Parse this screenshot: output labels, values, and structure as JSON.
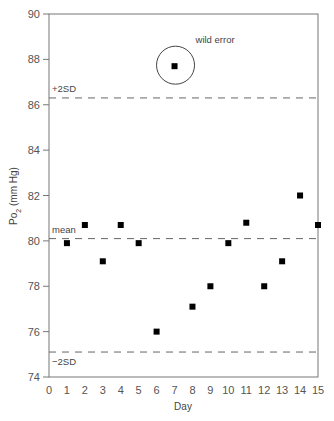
{
  "chart_data": {
    "type": "scatter",
    "title": "",
    "xlabel": "Day",
    "ylabel": "Po2 (mm Hg)",
    "ylabel_main": "Po",
    "ylabel_sub": "2",
    "ylabel_unit": " (mm Hg)",
    "xlim": [
      0,
      15
    ],
    "ylim": [
      74,
      90
    ],
    "x_ticks": [
      "0",
      "1",
      "2",
      "3",
      "4",
      "5",
      "6",
      "7",
      "8",
      "9",
      "10",
      "11",
      "12",
      "13",
      "14",
      "15"
    ],
    "y_ticks": [
      "74",
      "76",
      "78",
      "80",
      "82",
      "84",
      "86",
      "88",
      "90"
    ],
    "grid": false,
    "series": [
      {
        "name": "Po2 daily measurement",
        "x": [
          1,
          2,
          3,
          4,
          5,
          6,
          7,
          8,
          9,
          10,
          11,
          12,
          13,
          14,
          15
        ],
        "y": [
          79.9,
          80.7,
          79.1,
          80.7,
          79.9,
          76.0,
          87.7,
          77.1,
          78.0,
          79.9,
          80.8,
          78.0,
          79.1,
          82.0,
          80.7
        ]
      }
    ],
    "reference_lines": [
      {
        "label": "+2SD",
        "y": 86.3
      },
      {
        "label": "mean",
        "y": 80.1
      },
      {
        "label": "−2SD",
        "y": 75.1
      }
    ],
    "annotations": [
      {
        "text": "wild error",
        "x": 7,
        "y": 87.7,
        "shape": "circle"
      }
    ]
  }
}
